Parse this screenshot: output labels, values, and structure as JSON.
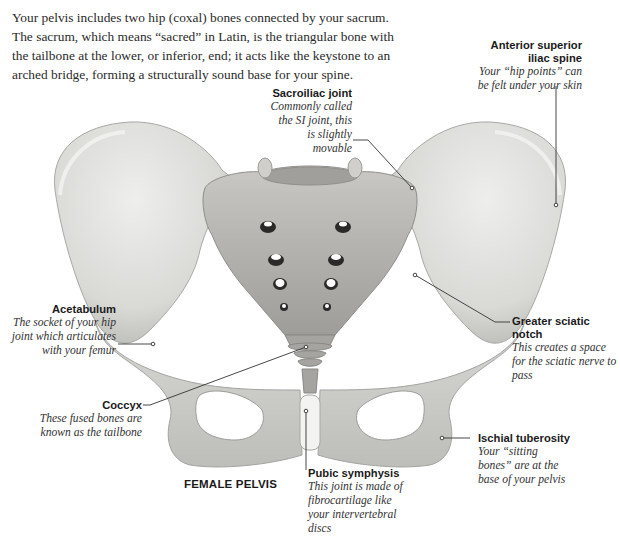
{
  "intro": {
    "text": "Your pelvis includes two hip (coxal) bones connected by your sacrum. The sacrum, which means “sacred” in Latin, is the triangular bone with the tailbone at the lower, or inferior, end; it acts like the keystone to an arched bridge, forming a structurally sound base for your spine."
  },
  "figure": {
    "title": "FEMALE PELVIS"
  },
  "labels": [
    {
      "id": "asis",
      "title": "Anterior superior iliac spine",
      "desc": "Your “hip points” can be felt under your skin"
    },
    {
      "id": "si_joint",
      "title": "Sacroiliac joint",
      "desc": "Commonly called the SI joint, this is slightly movable"
    },
    {
      "id": "acetabulum",
      "title": "Acetabulum",
      "desc": "The socket of your hip joint which articulates with your femur"
    },
    {
      "id": "sciatic_notch",
      "title": "Greater sciatic notch",
      "desc": "This creates a space for the sciatic nerve to pass"
    },
    {
      "id": "coccyx",
      "title": "Coccyx",
      "desc": "These fused bones are known as the tailbone"
    },
    {
      "id": "ischial",
      "title": "Ischial tuberosity",
      "desc": "Your “sitting bones” are at the base of your pelvis"
    },
    {
      "id": "pubic",
      "title": "Pubic symphysis",
      "desc": "This joint is made of fibrocartilage like your intervertebral discs"
    }
  ],
  "colors": {
    "bone_light": "#e6e6e3",
    "bone_mid": "#cfcfcc",
    "bone_dark": "#a9a9a6",
    "sacrum": "#bdbcb8",
    "leader_line": "#333333",
    "cartilage": "#f2f2f0"
  }
}
